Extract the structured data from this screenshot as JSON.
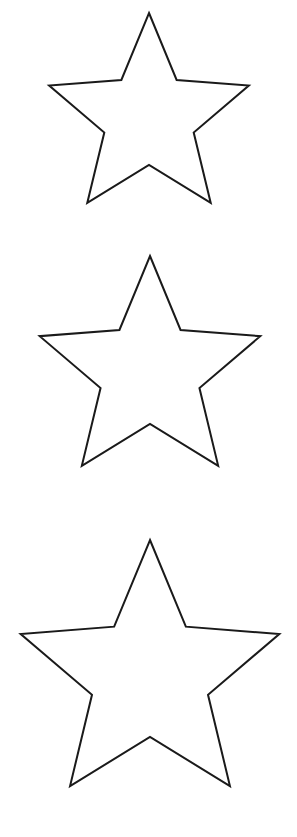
{
  "page": {
    "width": 297,
    "height": 837,
    "background_color": "#ffffff"
  },
  "style": {
    "stroke_color": "#1a1a1a",
    "fill_color": "#ffffff",
    "stroke_width": 2
  },
  "shapes": {
    "count": 3,
    "type": "five-pointed-star-outline",
    "items": [
      {
        "label": "Small star",
        "name": "star-small",
        "center_x": 149,
        "center_y": 118,
        "outer_radius": 105,
        "inner_radius": 47,
        "rotation_deg": 0,
        "points": 5,
        "apex_x": 148,
        "apex_y": 13,
        "left_point_x": 44,
        "left_point_y": 82,
        "right_point_x": 253,
        "right_point_y": 84,
        "bottom_left_point_x": 85,
        "bottom_left_point_y": 208,
        "bottom_right_point_x": 215,
        "bottom_right_point_y": 208
      },
      {
        "label": "Medium star",
        "name": "star-medium",
        "center_x": 150,
        "center_y": 372,
        "outer_radius": 116,
        "inner_radius": 52,
        "rotation_deg": 0,
        "points": 5,
        "apex_x": 149,
        "apex_y": 266,
        "left_point_x": 34,
        "left_point_y": 355,
        "right_point_x": 265,
        "right_point_y": 352,
        "bottom_left_point_x": 79,
        "bottom_left_point_y": 490,
        "bottom_right_point_x": 220,
        "bottom_right_point_y": 490
      },
      {
        "label": "Large star",
        "name": "star-large",
        "center_x": 150,
        "center_y": 676,
        "outer_radius": 136,
        "inner_radius": 61,
        "rotation_deg": 0,
        "points": 5,
        "apex_x": 150,
        "apex_y": 561,
        "left_point_x": 13,
        "left_point_y": 648,
        "right_point_x": 286,
        "right_point_y": 648,
        "bottom_left_point_x": 66,
        "bottom_left_point_y": 813,
        "bottom_right_point_x": 232,
        "bottom_right_point_y": 813
      }
    ]
  }
}
